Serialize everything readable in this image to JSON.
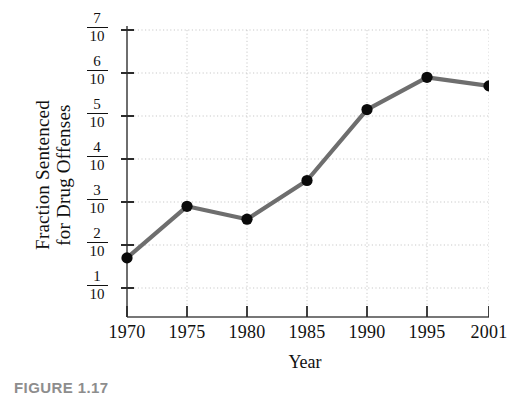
{
  "figure": {
    "caption": "FIGURE 1.17"
  },
  "chart_data": {
    "type": "line",
    "title": "",
    "subtitle": "",
    "xlabel": "Year",
    "ylabel": "Fraction Sentenced for Drug Offenses",
    "ylabel_lines": [
      "Fraction Sentenced",
      "for Drug Offenses"
    ],
    "categories": [
      "1970",
      "1975",
      "1980",
      "1985",
      "1990",
      "1995",
      "2001"
    ],
    "x": [
      1970,
      1975,
      1980,
      1985,
      1990,
      1995,
      2001
    ],
    "values": [
      0.17,
      0.29,
      0.26,
      0.35,
      0.515,
      0.59,
      0.57
    ],
    "point_labels": [
      "",
      "",
      "",
      "",
      "",
      "",
      ""
    ],
    "ylim": [
      0.0,
      0.72
    ],
    "xtick_labels": [
      "1970",
      "1975",
      "1980",
      "1985",
      "1990",
      "1995",
      "2001"
    ],
    "ytick_values": [
      0.1,
      0.2,
      0.3,
      0.4,
      0.5,
      0.6,
      0.7
    ],
    "ytick_labels": [
      "1/10",
      "2/10",
      "3/10",
      "4/10",
      "5/10",
      "6/10",
      "7/10"
    ],
    "ytick_numerators": [
      "1",
      "2",
      "3",
      "4",
      "5",
      "6",
      "7"
    ],
    "ytick_denominators": [
      "10",
      "10",
      "10",
      "10",
      "10",
      "10",
      "10"
    ],
    "grid": true,
    "grid_style": "dotted",
    "legend": false,
    "legend_position": "none",
    "line_color": "#6e6e6e",
    "marker_color": "#0a0a0a",
    "axis_color": "#4a4a4a",
    "grid_color": "#c9c9c9",
    "caption_color": "#8d8d8d"
  }
}
